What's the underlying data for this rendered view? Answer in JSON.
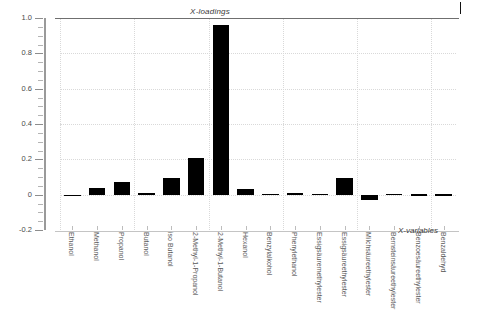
{
  "chart_data": {
    "type": "bar",
    "title": "X-loadings",
    "xlabel": "X-variables",
    "ylabel": "",
    "ylim": [
      -0.2,
      1.0
    ],
    "grid": true,
    "legend": null,
    "categories": [
      "Ethanol",
      "Methanol",
      "Propanol",
      "Butanol",
      "iso Butanol",
      "2-Methyl-1-Propanol",
      "2-Methyl-1-Butanol",
      "Hexanol",
      "Benzylalkohol",
      "Phenylethanol",
      "Essigsäuremethylester",
      "Essigsäureethylester",
      "Milchsäureethylester",
      "Bernsteinsäureethylester",
      "Benzoesäureethylester",
      "Benzaldehyd"
    ],
    "values": [
      -0.005,
      0.038,
      0.073,
      0.012,
      0.093,
      0.208,
      0.958,
      0.031,
      0.004,
      0.012,
      0.006,
      0.092,
      -0.032,
      0.003,
      0.002,
      0.001
    ],
    "y_ticks": [
      -0.2,
      0,
      0.2,
      0.4,
      0.6,
      0.8,
      1.0
    ],
    "y_tick_labels": [
      "-0.2",
      "0",
      "0.2",
      "0.4",
      "0.6",
      "0.8",
      "1.0"
    ],
    "bar_color": "#000000",
    "grid_color": "#d9d9d9",
    "axis_color": "#9a9a9a"
  }
}
